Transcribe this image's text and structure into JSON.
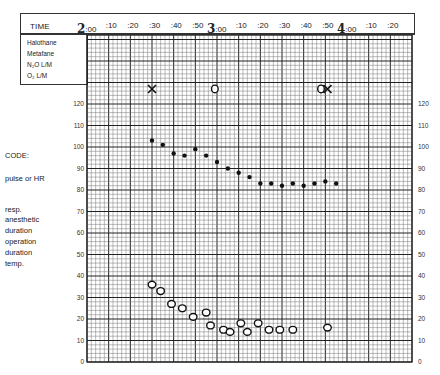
{
  "header": {
    "time_label": "TIME",
    "ticks": [
      {
        "hour": "2",
        "min": ":00"
      },
      {
        "hour": "",
        "min": ":10"
      },
      {
        "hour": "",
        "min": ":20"
      },
      {
        "hour": "",
        "min": ":30"
      },
      {
        "hour": "",
        "min": ":40"
      },
      {
        "hour": "",
        "min": ":50"
      },
      {
        "hour": "3",
        "min": ":00"
      },
      {
        "hour": "",
        "min": ":10"
      },
      {
        "hour": "",
        "min": ":20"
      },
      {
        "hour": "",
        "min": ":30"
      },
      {
        "hour": "",
        "min": ":40"
      },
      {
        "hour": "",
        "min": ":50"
      },
      {
        "hour": "4",
        "min": ":00"
      },
      {
        "hour": "",
        "min": ":10"
      },
      {
        "hour": "",
        "min": ":20"
      }
    ]
  },
  "agents": [
    "Halothane",
    "Metafane",
    "N₂O L/M",
    "O₂ L/M"
  ],
  "code": {
    "title": "CODE:",
    "items": [
      "pulse or HR",
      "resp.",
      "anesthetic",
      "duration",
      "operation",
      "duration",
      "temp."
    ]
  },
  "y_ticks": [
    "120",
    "110",
    "100",
    "90",
    "80",
    "70",
    "60",
    "50",
    "40",
    "30",
    "20",
    "10",
    "0"
  ],
  "chart_data": {
    "type": "scatter",
    "xlabel": "TIME",
    "ylabel": "",
    "x_unit": "minutes after 2:00",
    "xlim": [
      0,
      150
    ],
    "ylim": [
      0,
      120
    ],
    "grid": true,
    "x_tick_labels": [
      "2:00",
      ":10",
      ":20",
      ":30",
      ":40",
      ":50",
      "3:00",
      ":10",
      ":20",
      ":30",
      ":40",
      ":50",
      "4:00",
      ":10",
      ":20"
    ],
    "y_tick_labels": [
      "0",
      "10",
      "20",
      "30",
      "40",
      "50",
      "60",
      "70",
      "80",
      "90",
      "100",
      "110",
      "120"
    ],
    "series": [
      {
        "name": "pulse or HR",
        "marker": "dot",
        "x": [
          30,
          35,
          40,
          45,
          50,
          55,
          60,
          65,
          70,
          75,
          80,
          85,
          90,
          95,
          100,
          105,
          110,
          115
        ],
        "y": [
          103,
          101,
          97,
          96,
          99,
          96,
          93,
          90,
          88,
          86,
          83,
          83,
          82,
          83,
          82,
          83,
          84,
          83
        ]
      },
      {
        "name": "resp.",
        "marker": "open-circle",
        "x": [
          30,
          34,
          39,
          44,
          49,
          55,
          57,
          63,
          66,
          71,
          74,
          79,
          84,
          89,
          95,
          111
        ],
        "y": [
          36,
          33,
          27,
          25,
          21,
          23,
          17,
          15,
          14,
          18,
          14,
          18,
          15,
          15,
          15,
          16
        ]
      },
      {
        "name": "anesthetic duration",
        "marker": "x",
        "x": [
          30,
          111
        ],
        "y": [
          127,
          127
        ]
      },
      {
        "name": "operation duration",
        "marker": "o",
        "x": [
          59,
          108
        ],
        "y": [
          127,
          127
        ]
      }
    ]
  }
}
